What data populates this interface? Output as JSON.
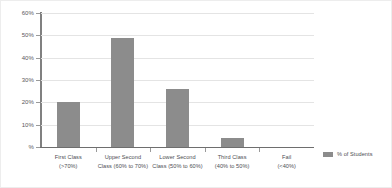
{
  "chart_data": {
    "type": "bar",
    "title": "",
    "subtitle": "",
    "xlabel": "",
    "ylabel": "%",
    "ylim": [
      0,
      60
    ],
    "grid": true,
    "legend_position": "right",
    "categories": [
      "First Class (>70%)",
      "Upper Second Class (60% to 70%)",
      "Lower Second Class (50% to 60%)",
      "Third Class (40% to 50%)",
      "Fail (<40%)"
    ],
    "category_lines": [
      {
        "line1": "First Class",
        "line2": "(>70%)"
      },
      {
        "line1": "Upper Second",
        "line2": "Class (60% to 70%)"
      },
      {
        "line1": "Lower Second",
        "line2": "Class (50% to 60%)"
      },
      {
        "line1": "Third Class",
        "line2": "(40% to 50%)"
      },
      {
        "line1": "Fail",
        "line2": "(<40%)"
      }
    ],
    "series": [
      {
        "name": "% of Students",
        "color": "#8c8c8c",
        "values": [
          20,
          49,
          26,
          4,
          0
        ]
      }
    ],
    "y_ticks": [
      {
        "value": 0,
        "label": "%"
      },
      {
        "value": 10,
        "label": "10%"
      },
      {
        "value": 20,
        "label": "20%"
      },
      {
        "value": 30,
        "label": "30%"
      },
      {
        "value": 40,
        "label": "40%"
      },
      {
        "value": 50,
        "label": "50%"
      },
      {
        "value": 60,
        "label": "60%"
      }
    ]
  },
  "legend": {
    "entries": [
      {
        "label": "% of Students",
        "color": "#8c8c8c"
      }
    ]
  },
  "colors": {
    "bar": "#8c8c8c",
    "gridline": "#e4e4e4",
    "axis": "#808080",
    "text": "#4d4e53",
    "background": "#ffffff"
  }
}
